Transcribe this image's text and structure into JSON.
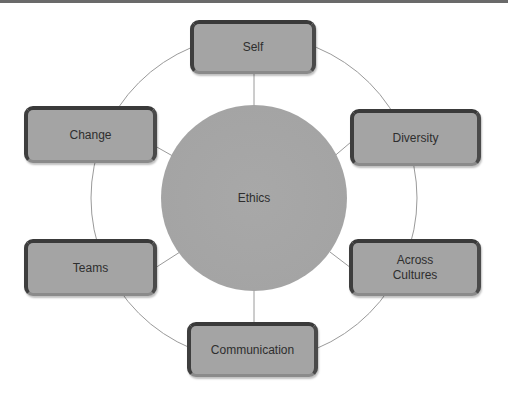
{
  "diagram": {
    "type": "radial-cycle",
    "center": {
      "label": "Ethics"
    },
    "nodes": [
      {
        "id": "self",
        "label": "Self"
      },
      {
        "id": "diversity",
        "label": "Diversity"
      },
      {
        "id": "across-cultures",
        "label": "Across\nCultures"
      },
      {
        "id": "communication",
        "label": "Communication"
      },
      {
        "id": "teams",
        "label": "Teams"
      },
      {
        "id": "change",
        "label": "Change"
      }
    ],
    "colors": {
      "node_fill": "#a4a4a4",
      "node_border": "#3a3a3a",
      "text": "#2e2e2e",
      "connector": "#8c8c8c"
    }
  }
}
